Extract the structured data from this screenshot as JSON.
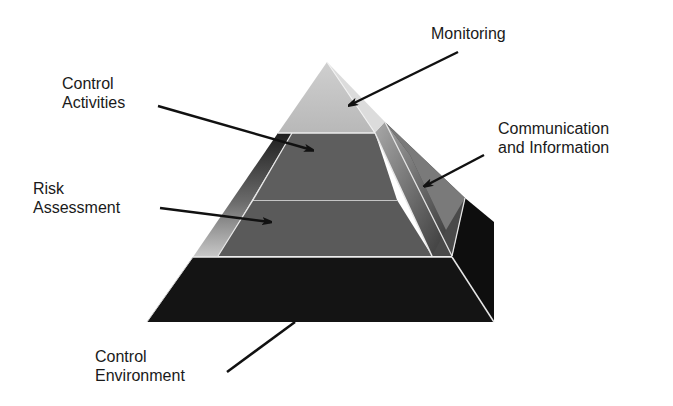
{
  "diagram": {
    "type": "layered-pyramid",
    "layers": [
      {
        "id": "monitoring",
        "label_lines": [
          "Monitoring"
        ],
        "color": "#bdbdbd"
      },
      {
        "id": "communication",
        "label_lines": [
          "Communication",
          "and Information"
        ],
        "color": "#6e6e6e"
      },
      {
        "id": "control-activities",
        "label_lines": [
          "Control",
          "Activities"
        ],
        "color": "#5c5c5c"
      },
      {
        "id": "risk-assessment",
        "label_lines": [
          "Risk",
          "Assessment"
        ],
        "color": "#5a5a5a"
      },
      {
        "id": "control-environment",
        "label_lines": [
          "Control",
          "Environment"
        ],
        "color": "#151515"
      }
    ]
  },
  "labels": {
    "monitoring": "Monitoring",
    "control_activities_1": "Control",
    "control_activities_2": "Activities",
    "communication_1": "Communication",
    "communication_2": "and Information",
    "risk_1": "Risk",
    "risk_2": "Assessment",
    "environment_1": "Control",
    "environment_2": "Environment"
  }
}
